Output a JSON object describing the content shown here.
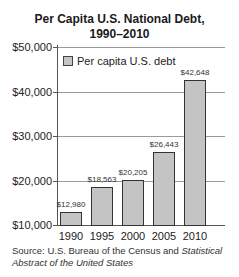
{
  "chart_data": {
    "type": "bar",
    "title": "Per Capita U.S. National Debt, 1990–2010",
    "title_lines": [
      "Per Capita U.S. National Debt,",
      "1990–2010"
    ],
    "categories": [
      "1990",
      "1995",
      "2000",
      "2005",
      "2010"
    ],
    "series": [
      {
        "name": "Per capita U.S. debt",
        "values": [
          12980,
          18563,
          20205,
          26443,
          42648
        ],
        "labels": [
          "$12,980",
          "$18,563",
          "$20,205",
          "$26,443",
          "$42,648"
        ],
        "color": "#c4c4c4"
      }
    ],
    "xlabel": "",
    "ylabel": "",
    "ylim": [
      10000,
      50000
    ],
    "yticks": [
      10000,
      20000,
      30000,
      40000,
      50000
    ],
    "ytick_labels": [
      "$10,000",
      "$20,000",
      "$30,000",
      "$40,000",
      "$50,000"
    ],
    "grid": true,
    "legend_position": "top-left inside",
    "source": {
      "prefix": "Source: U.S. Bureau of the Census and ",
      "italic": "Statistical Abstract of the United States"
    }
  }
}
